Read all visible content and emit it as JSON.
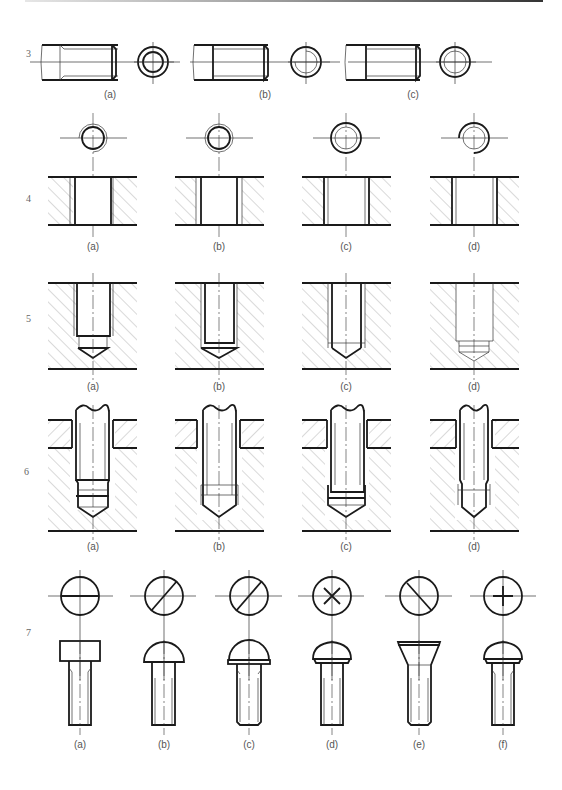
{
  "figure": {
    "rows": [
      {
        "number": "3",
        "labels": [
          "(a)",
          "(b)",
          "(c)"
        ],
        "subject": "external thread representation"
      },
      {
        "number": "4",
        "labels": [
          "(a)",
          "(b)",
          "(c)",
          "(d)"
        ],
        "subject": "internal thread through-hole section"
      },
      {
        "number": "5",
        "labels": [
          "(a)",
          "(b)",
          "(c)",
          "(d)"
        ],
        "subject": "blind tapped hole section"
      },
      {
        "number": "6",
        "labels": [
          "(a)",
          "(b)",
          "(c)",
          "(d)"
        ],
        "subject": "stud screw assembly in tapped hole"
      },
      {
        "number": "7",
        "labels": [
          "(a)",
          "(b)",
          "(c)",
          "(d)",
          "(e)",
          "(f)"
        ],
        "subject": "screw heads with top views"
      }
    ]
  },
  "colors": {
    "line": "#1a1a1a",
    "thin": "#333333",
    "hatch": "#666666",
    "label": "#555555"
  }
}
